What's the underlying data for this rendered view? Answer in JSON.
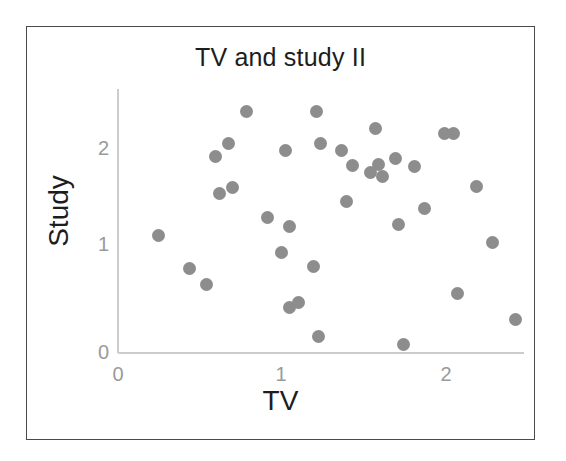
{
  "figure": {
    "title": "TV and study II",
    "frame_color": "#4a4a4a",
    "background": "#ffffff"
  },
  "axes": {
    "x_label": "TV",
    "y_label": "Study",
    "x_ticks": [
      "0",
      "1",
      "2"
    ],
    "y_ticks": [
      "0",
      "1",
      "2"
    ],
    "axis_line_color": "#cccccc",
    "tick_label_color": "#9a9a9a"
  },
  "marker": {
    "color": "#8d8d8d",
    "shape": "circle",
    "size_px": 13
  },
  "chart_data": {
    "type": "scatter",
    "title": "TV and study II",
    "xlabel": "TV",
    "ylabel": "Study",
    "xlim": [
      0,
      2.55
    ],
    "ylim": [
      0,
      2.55
    ],
    "xticks": [
      0,
      1,
      2
    ],
    "yticks": [
      0,
      1,
      2
    ],
    "grid": false,
    "legend": false,
    "series": [
      {
        "name": "observations",
        "points": [
          [
            0.25,
            1.15
          ],
          [
            0.44,
            0.83
          ],
          [
            0.54,
            0.67
          ],
          [
            0.6,
            1.93
          ],
          [
            0.62,
            1.56
          ],
          [
            0.68,
            2.05
          ],
          [
            0.7,
            1.62
          ],
          [
            0.79,
            2.37
          ],
          [
            0.92,
            1.33
          ],
          [
            1.0,
            0.99
          ],
          [
            1.03,
            1.99
          ],
          [
            1.05,
            1.24
          ],
          [
            1.05,
            0.45
          ],
          [
            1.11,
            0.5
          ],
          [
            1.2,
            0.85
          ],
          [
            1.22,
            2.37
          ],
          [
            1.23,
            0.16
          ],
          [
            1.24,
            2.05
          ],
          [
            1.37,
            1.99
          ],
          [
            1.4,
            1.49
          ],
          [
            1.44,
            1.84
          ],
          [
            1.55,
            1.77
          ],
          [
            1.58,
            2.2
          ],
          [
            1.6,
            1.85
          ],
          [
            1.62,
            1.73
          ],
          [
            1.7,
            1.91
          ],
          [
            1.72,
            1.26
          ],
          [
            1.75,
            0.08
          ],
          [
            1.82,
            1.83
          ],
          [
            1.88,
            1.42
          ],
          [
            2.0,
            2.15
          ],
          [
            2.06,
            2.15
          ],
          [
            2.08,
            0.58
          ],
          [
            2.2,
            1.63
          ],
          [
            2.3,
            1.08
          ],
          [
            2.44,
            0.33
          ]
        ]
      }
    ]
  }
}
